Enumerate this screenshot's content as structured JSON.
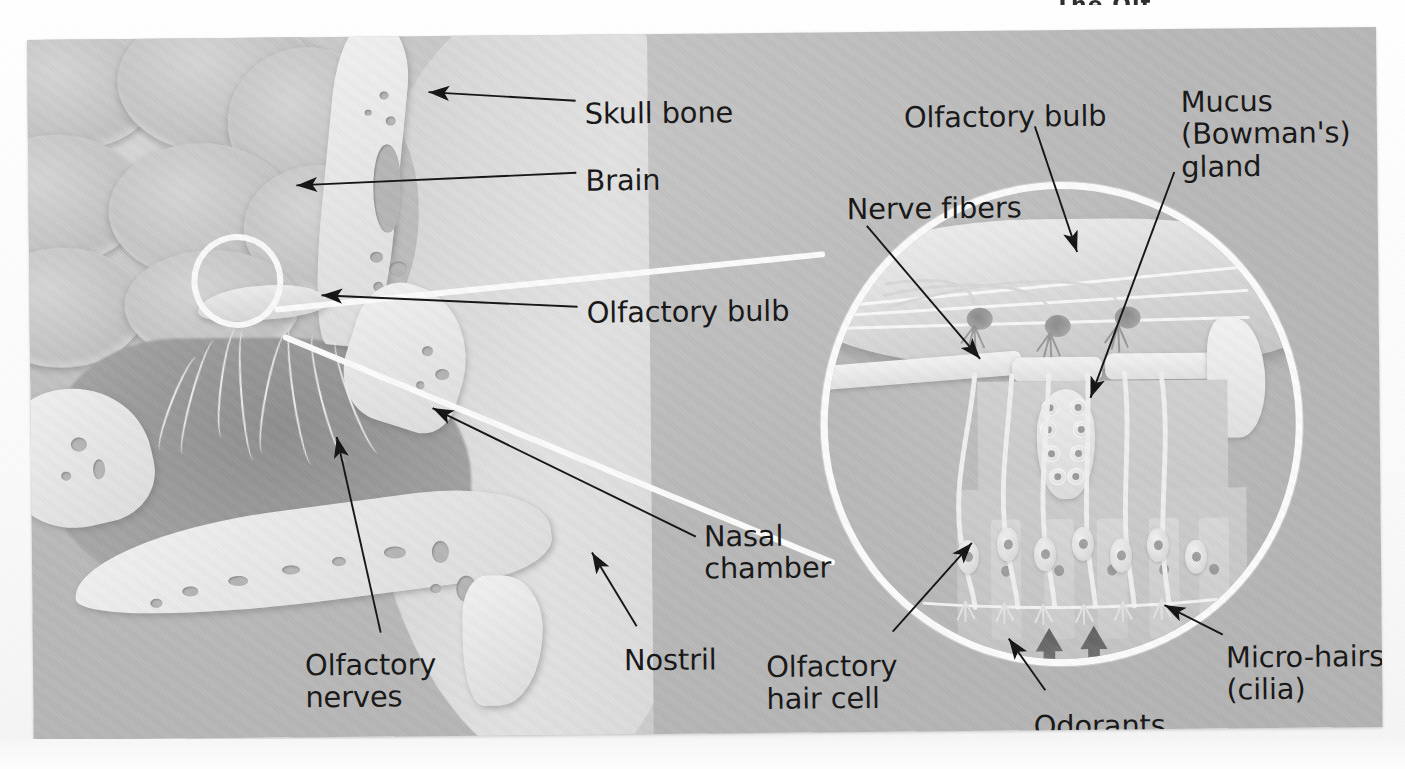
{
  "figure": {
    "title_fragment": "The Olf",
    "panel_background": "#bdbdbd"
  },
  "colors": {
    "label_text": "#141414",
    "leader_line": "#111111",
    "highlight_circle": "#fdfdfd",
    "bone": "#eeeeee",
    "brain": "#c6c6c6",
    "cavity": "#9a9a9a",
    "odorant_arrow": "#6e6e6e"
  },
  "labels": [
    {
      "id": "skull-bone",
      "text": "Skull bone",
      "x": 557,
      "y": 63,
      "lines": 1
    },
    {
      "id": "brain",
      "text": "Brain",
      "x": 557,
      "y": 130,
      "lines": 1
    },
    {
      "id": "olfactory-bulb",
      "text": "Olfactory bulb",
      "x": 557,
      "y": 262,
      "lines": 1
    },
    {
      "id": "nasal-chamber",
      "text": "Nasal\nchamber",
      "x": 672,
      "y": 487,
      "lines": 2
    },
    {
      "id": "nostril",
      "text": "Nostril",
      "x": 591,
      "y": 610,
      "lines": 1
    },
    {
      "id": "olfactory-nerves",
      "text": "Olfactory\nnerves",
      "x": 272,
      "y": 612,
      "lines": 2
    },
    {
      "id": "olfactory-bulb-inset",
      "text": "Olfactory bulb",
      "x": 876,
      "y": 70,
      "lines": 1
    },
    {
      "id": "mucus-gland",
      "text": "Mucus\n(Bowman's)\ngland",
      "x": 1153,
      "y": 57,
      "lines": 3
    },
    {
      "id": "nerve-fibers",
      "text": "Nerve fibers",
      "x": 818,
      "y": 161,
      "lines": 1
    },
    {
      "id": "olfactory-hair-cell",
      "text": "Olfactory\nhair cell",
      "x": 733,
      "y": 618,
      "lines": 2
    },
    {
      "id": "odorants",
      "text": "Odorants",
      "x": 1000,
      "y": 680,
      "lines": 1
    },
    {
      "id": "micro-hairs",
      "text": "Micro-hairs\n(cilia)",
      "x": 1193,
      "y": 613,
      "lines": 2
    }
  ],
  "leaders": [
    {
      "id": "leader-skull-bone",
      "from": [
        548,
        72
      ],
      "to": [
        400,
        63
      ],
      "arrow": true
    },
    {
      "id": "leader-brain",
      "from": [
        548,
        142
      ],
      "to": [
        266,
        150
      ],
      "arrow": true
    },
    {
      "id": "leader-olfactory-bulb",
      "from": [
        548,
        273
      ],
      "to": [
        291,
        258
      ],
      "arrow": true
    },
    {
      "id": "leader-nasal-chamber",
      "from": [
        660,
        505
      ],
      "to": [
        400,
        372
      ],
      "arrow": true
    },
    {
      "id": "leader-nostril",
      "from": [
        600,
        596
      ],
      "to": [
        558,
        520
      ],
      "arrow": true
    },
    {
      "id": "leader-olfactory-nerves",
      "from": [
        345,
        600
      ],
      "to": [
        305,
        398
      ],
      "arrow": true
    },
    {
      "id": "leader-bulb-inset",
      "from": [
        1010,
        98
      ],
      "to": [
        1050,
        225
      ],
      "arrow": true
    },
    {
      "id": "leader-mucus-gland",
      "from": [
        1148,
        145
      ],
      "to": [
        1063,
        370
      ],
      "arrow": true
    },
    {
      "id": "leader-nerve-fibers",
      "from": [
        838,
        196
      ],
      "to": [
        948,
        327
      ],
      "arrow": true
    },
    {
      "id": "leader-hair-cell",
      "from": [
        858,
        604
      ],
      "to": [
        938,
        512
      ],
      "arrow": true
    },
    {
      "id": "leader-odorants",
      "from": [
        1010,
        664
      ],
      "to": [
        975,
        610
      ],
      "arrow": true
    },
    {
      "id": "leader-micro-hairs",
      "from": [
        1190,
        608
      ],
      "to": [
        1133,
        578
      ],
      "arrow": true
    }
  ],
  "highlight": {
    "small_circle": {
      "cx": 235,
      "cy": 283,
      "r": 46
    },
    "inset_circle": {
      "cx": 1031,
      "cy": 394,
      "r": 241
    },
    "connector_label": "magnification-wedge"
  },
  "inset_parts": {
    "olfactory_bulb": "olfactory-bulb-tissue",
    "glomeruli_count": 3,
    "nerve_fiber_count": 3,
    "mucus_gland": "bowmans-gland",
    "hair_cells": 9,
    "odorant_arrows": 2,
    "cilia_layer": "micro-hairs-cilia"
  }
}
